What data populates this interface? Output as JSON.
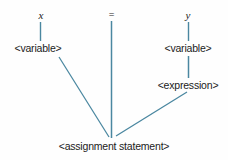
{
  "diagram": {
    "type": "parse-tree",
    "background_color": "#fefefe",
    "edge_color": "#4a87a0",
    "text_color": "#1b1b1b",
    "nodes": {
      "terminal_x": "x",
      "terminal_equals": "=",
      "terminal_y": "y",
      "variable_left": "<variable>",
      "variable_right": "<variable>",
      "expression": "<expression>",
      "assignment_statement": "<assignment statement>"
    }
  }
}
